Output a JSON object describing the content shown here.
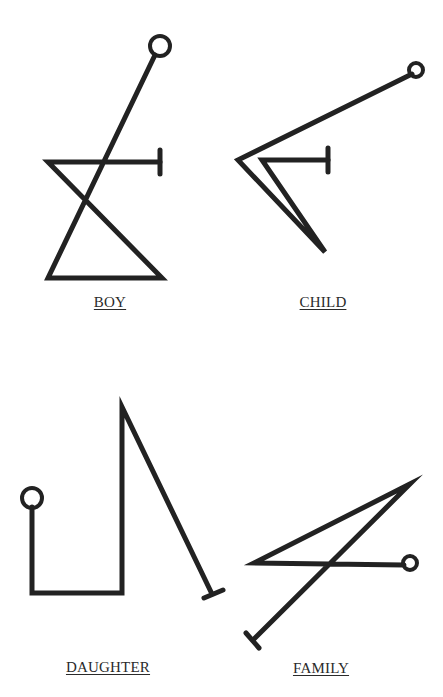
{
  "figure": {
    "stroke_color": "#222222",
    "background": "#ffffff",
    "stroke_width": 5
  },
  "sigils": [
    {
      "label": "BOY",
      "label_pos": [
        110,
        305
      ],
      "path": "M 155 55 L 48 278 L 162 278 L 48 162 L 160 162",
      "circle": [
        160,
        46,
        10
      ],
      "bar": [
        [
          160,
          150
        ],
        [
          160,
          174
        ]
      ]
    },
    {
      "label": "CHILD",
      "label_pos": [
        323,
        305
      ],
      "path": "M 412 74 L 238 160 L 325 252 L 262 160 L 328 160",
      "circle": [
        416,
        70,
        7
      ],
      "bar": [
        [
          328,
          148
        ],
        [
          328,
          172
        ]
      ]
    },
    {
      "label": "DAUGHTER",
      "label_pos": [
        108,
        670
      ],
      "path": "M 32 507 L 32 593 L 122 593 L 122 407 L 212 594",
      "circle": [
        32,
        498,
        10
      ],
      "bar": [
        [
          204,
          598
        ],
        [
          223,
          590
        ]
      ]
    },
    {
      "label": "FAMILY",
      "label_pos": [
        321,
        671
      ],
      "path": "M 404 565 L 254 563 L 410 484 L 253 640",
      "circle": [
        410,
        563,
        7
      ],
      "bar": [
        [
          246,
          633
        ],
        [
          259,
          648
        ]
      ]
    }
  ]
}
